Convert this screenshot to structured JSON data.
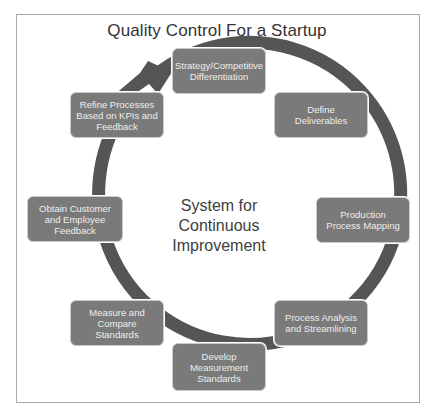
{
  "diagram": {
    "title": "Quality Control For a Startup",
    "center_label": "System for Continuous Improvement",
    "type": "cycle",
    "colors": {
      "ring": "#555555",
      "box_fill": "#7a7a7a",
      "box_text": "#eeeeee",
      "frame_border": "#a9a9a9",
      "title_text": "#333333"
    },
    "steps": [
      {
        "label": "Strategy/Competitive Differentiation"
      },
      {
        "label": "Define Deliverables"
      },
      {
        "label": "Production Process Mapping"
      },
      {
        "label": "Process Analysis and Streamlining"
      },
      {
        "label": "Develop Measurement Standards"
      },
      {
        "label": "Measure and Compare Standards"
      },
      {
        "label": "Obtain Customer and Employee Feedback"
      },
      {
        "label": "Refine Processes Based on KPIs and Feedback"
      }
    ],
    "arrow_direction": "clockwise"
  }
}
